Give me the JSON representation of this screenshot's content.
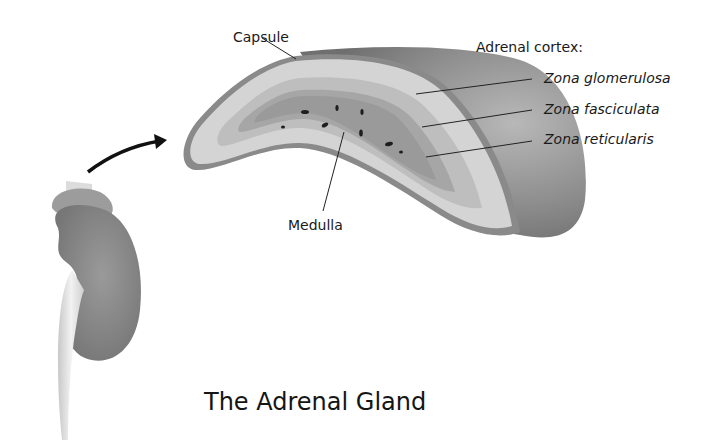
{
  "title": "The Adrenal Gland",
  "labels": {
    "capsule": "Capsule",
    "adrenal_cortex": "Adrenal cortex:",
    "zona_glomerulosa": "Zona glomerulosa",
    "zona_fasciculata": "Zona fasciculata",
    "zona_reticularis": "Zona reticularis",
    "medulla": "Medulla"
  },
  "colors": {
    "capsule_outer": "#8a8a8a",
    "glomerulosa": "#d2d2d2",
    "fasciculata": "#bdbdbd",
    "reticularis": "#a9a9a9",
    "medulla": "#9a9a9a",
    "kidney": "#8c8c8c",
    "arrow": "#111111"
  }
}
